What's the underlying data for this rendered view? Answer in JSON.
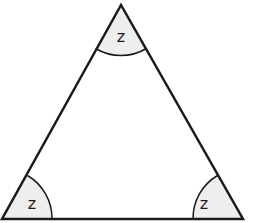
{
  "diagram": {
    "type": "triangle",
    "colors": {
      "stroke": "#1a1a1a",
      "angle_fill": "#eeeeee",
      "background": "#ffffff"
    },
    "angles": [
      {
        "vertex": "top",
        "label": "z"
      },
      {
        "vertex": "bottom-left",
        "label": "z"
      },
      {
        "vertex": "bottom-right",
        "label": "z"
      }
    ]
  }
}
